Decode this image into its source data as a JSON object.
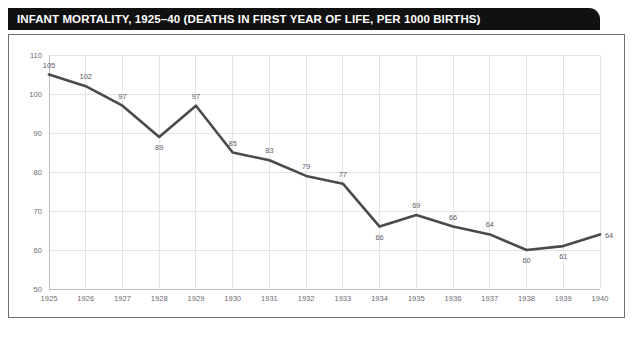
{
  "title": "INFANT MORTALITY, 1925–40 (DEATHS IN FIRST YEAR OF LIFE, PER 1000 BIRTHS)",
  "colors": {
    "title_bar_background": "#111111",
    "title_text": "#ffffff",
    "panel_border": "#6e6e72",
    "gridline": "#e4e4e6",
    "data_line": "#4a4a4e",
    "tick_text": "#6b6b70",
    "point_label_text": "#5a5a5f",
    "background": "#ffffff"
  },
  "chart_data": {
    "type": "line",
    "title": "INFANT MORTALITY, 1925–40 (DEATHS IN FIRST YEAR OF LIFE, PER 1000 BIRTHS)",
    "xlabel": "",
    "ylabel": "",
    "categories": [
      1925,
      1926,
      1927,
      1928,
      1929,
      1930,
      1931,
      1932,
      1933,
      1934,
      1935,
      1936,
      1937,
      1938,
      1939,
      1940
    ],
    "x_tick_labels": [
      "1925",
      "1926",
      "1927",
      "1928",
      "1929",
      "1930",
      "1931",
      "1932",
      "1933",
      "1934",
      "1935",
      "1936",
      "1937",
      "1938",
      "1939",
      "1940"
    ],
    "values": [
      105,
      102,
      97,
      89,
      97,
      85,
      83,
      79,
      77,
      66,
      69,
      66,
      64,
      60,
      61,
      64
    ],
    "point_labels": [
      "105",
      "102",
      "97",
      "89",
      "97",
      "85",
      "83",
      "79",
      "77",
      "66",
      "69",
      "66",
      "64",
      "60",
      "61",
      "64"
    ],
    "label_positions": [
      "above",
      "above",
      "above",
      "below",
      "above",
      "above",
      "above",
      "above",
      "above",
      "below",
      "above",
      "above",
      "above",
      "below",
      "below",
      "right"
    ],
    "y_tick_labels": [
      "50",
      "60",
      "70",
      "80",
      "90",
      "100",
      "110"
    ],
    "y_ticks": [
      50,
      60,
      70,
      80,
      90,
      100,
      110
    ],
    "ylim": [
      50,
      110
    ],
    "xlim": [
      1925,
      1940
    ],
    "grid": true,
    "grid_axes": "both",
    "legend": false,
    "markers": false
  }
}
